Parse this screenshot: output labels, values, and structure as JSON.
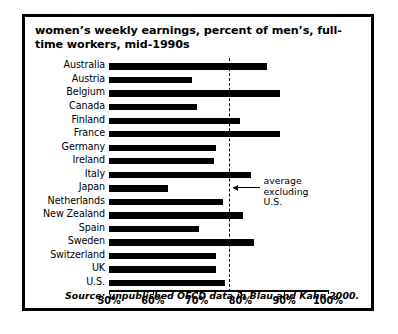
{
  "figure": {
    "title": "women’s weekly earnings, percent of men’s,\nfull-time workers, mid-1990s",
    "source": "Source: unpublished OECD data in Blau and Kahn 2000."
  },
  "annotation": {
    "line1": "average",
    "line2": "excluding",
    "line3": "U.S."
  },
  "chart_data": {
    "type": "bar",
    "orientation": "horizontal",
    "title": "women’s weekly earnings, percent of men’s, full-time workers, mid-1990s",
    "xlabel": "",
    "ylabel": "",
    "xlim": [
      50,
      100
    ],
    "xticks": [
      50,
      60,
      70,
      80,
      90,
      100
    ],
    "xtick_labels": [
      "50%",
      "60%",
      "70%",
      "80%",
      "90%",
      "100%"
    ],
    "grid": false,
    "legend": "none",
    "categories": [
      "Australia",
      "Austria",
      "Belgium",
      "Canada",
      "Finland",
      "France",
      "Germany",
      "Ireland",
      "Italy",
      "Japan",
      "Netherlands",
      "New Zealand",
      "Spain",
      "Sweden",
      "Switzerland",
      "UK",
      "U.S."
    ],
    "values": [
      86,
      69,
      89,
      70,
      80,
      89,
      74.5,
      74,
      82.5,
      63.5,
      76,
      80.5,
      70.5,
      83,
      74.5,
      74.5,
      76.5
    ],
    "annotations": [
      {
        "type": "vline",
        "value": 77.5,
        "style": "dashed",
        "label": "average excluding U.S."
      }
    ],
    "colors": {
      "bar": "#000000",
      "background": "#ffffff",
      "axis": "#000000"
    }
  }
}
